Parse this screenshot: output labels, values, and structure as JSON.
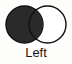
{
  "figure": {
    "caption": "Left",
    "background_color": "#fdfdfc",
    "width": 72,
    "height": 64
  },
  "venn": {
    "type": "two-circle-venn",
    "stroke_color": "#111111",
    "stroke_width": 1.4,
    "left_circle": {
      "name": "left-circle",
      "state": "filled",
      "fill_color": "#2a2a2a",
      "cx": 24.5,
      "cy": 24.5,
      "r": 18.5
    },
    "right_circle": {
      "name": "right-circle",
      "state": "empty",
      "fill_color": "#ffffff",
      "cx": 47.5,
      "cy": 24.5,
      "r": 18.5
    },
    "intersection": {
      "name": "intersection-lens",
      "state": "filled",
      "fill_color": "#2a2a2a"
    }
  }
}
